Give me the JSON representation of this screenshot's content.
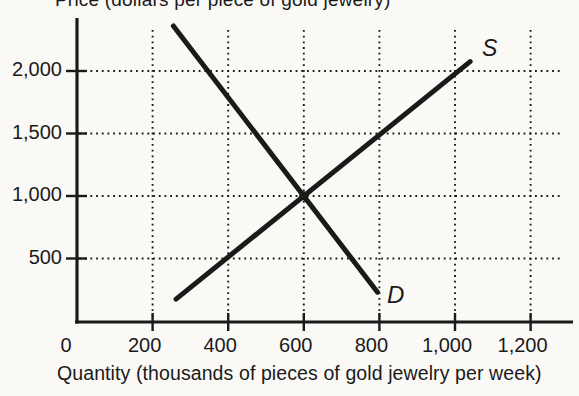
{
  "colors": {
    "ink": "#1a1a1a",
    "paper": "#faf9f6"
  },
  "chart_data": {
    "type": "line",
    "title": "Price (dollars per piece of gold jewelry)",
    "xlabel": "Quantity (thousands of pieces of gold jewelry per week)",
    "ylabel": "Price (dollars per piece of gold jewelry)",
    "xlim": [
      0,
      1310
    ],
    "ylim": [
      0,
      2420
    ],
    "x_ticks": [
      0,
      200,
      400,
      600,
      800,
      1000,
      1200
    ],
    "x_tick_labels": [
      "0",
      "200",
      "400",
      "600",
      "800",
      "1,000",
      "1,200"
    ],
    "y_ticks": [
      500,
      1000,
      1500,
      2000
    ],
    "y_tick_labels": [
      "500",
      "1,000",
      "1,500",
      "2,000"
    ],
    "grid": "dotted",
    "legend_position": "labels-at-curve-ends",
    "series": [
      {
        "name": "demand",
        "label": "D",
        "points": [
          [
            255,
            2360
          ],
          [
            795,
            230
          ]
        ]
      },
      {
        "name": "supply",
        "label": "S",
        "points": [
          [
            262,
            175
          ],
          [
            1040,
            2075
          ]
        ]
      }
    ],
    "equilibrium": {
      "quantity": 600,
      "price": 1000
    }
  }
}
